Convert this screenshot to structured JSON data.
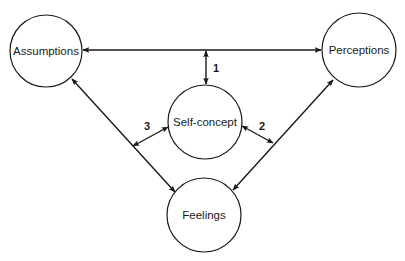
{
  "diagram": {
    "type": "concept-relationship",
    "nodes": [
      {
        "id": "assumptions",
        "label": "Assumptions",
        "cx": 46,
        "cy": 51,
        "r": 36
      },
      {
        "id": "perceptions",
        "label": "Perceptions",
        "cx": 359,
        "cy": 50,
        "r": 37
      },
      {
        "id": "self_concept",
        "label": "Self-concept",
        "cx": 205,
        "cy": 122,
        "r": 37
      },
      {
        "id": "feelings",
        "label": "Feelings",
        "cx": 204,
        "cy": 215,
        "r": 37
      }
    ],
    "edges": [
      {
        "id": "assumptions-perceptions",
        "from": "assumptions",
        "to": "perceptions",
        "bidirectional": true,
        "label": ""
      },
      {
        "id": "assumptions-feelings",
        "from": "assumptions",
        "to": "feelings",
        "bidirectional": true,
        "label": ""
      },
      {
        "id": "perceptions-feelings",
        "from": "perceptions",
        "to": "feelings",
        "bidirectional": true,
        "label": ""
      },
      {
        "id": "edge-1",
        "from": "assumptions-perceptions",
        "to": "self_concept",
        "bidirectional": true,
        "label": "1"
      },
      {
        "id": "edge-2",
        "from": "self_concept",
        "to": "perceptions-feelings",
        "bidirectional": true,
        "label": "2"
      },
      {
        "id": "edge-3",
        "from": "assumptions-feelings",
        "to": "self_concept",
        "bidirectional": true,
        "label": "3"
      }
    ]
  },
  "labels": {
    "assumptions": "Assumptions",
    "perceptions": "Perceptions",
    "self_concept": "Self-concept",
    "feelings": "Feelings",
    "edge1": "1",
    "edge2": "2",
    "edge3": "3"
  },
  "colors": {
    "stroke": "#1a1a1a",
    "background": "#ffffff"
  }
}
